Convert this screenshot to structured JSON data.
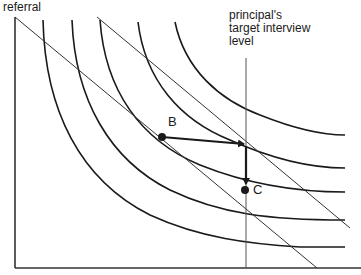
{
  "diagram": {
    "type": "indifference-curve-diagram",
    "axes": {
      "y_label": "referral",
      "x_label": ""
    },
    "annotations": {
      "target_line_label": [
        "principal's",
        "target interview",
        "level"
      ],
      "point_b": "B",
      "point_c": "C"
    },
    "elements": {
      "indifference_curves": 5,
      "budget_lines": 2,
      "vertical_target_line": true,
      "arrows": [
        "B to target line (horizontal)",
        "down target line to C (vertical)"
      ]
    },
    "colors": {
      "line": "#1a1a1a",
      "thin_line": "#333333",
      "background": "#ffffff"
    }
  }
}
